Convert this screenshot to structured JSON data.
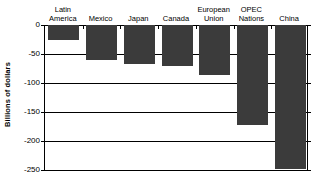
{
  "chart_data": {
    "type": "bar",
    "title": "",
    "xlabel": "",
    "ylabel": "Billions of dollars",
    "categories": [
      "Latin\nAmerica",
      "Mexico",
      "Japan",
      "Canada",
      "European\nUnion",
      "OPEC\nNations",
      "China"
    ],
    "values": [
      -25,
      -60,
      -67,
      -70,
      -86,
      -172,
      -248
    ],
    "ylim": [
      -250,
      0
    ],
    "yticks": [
      0,
      -50,
      -100,
      -150,
      -200,
      -250
    ],
    "ytick_labels": [
      "0",
      "-50",
      "-100",
      "-150",
      "-200",
      "-250"
    ],
    "grid": true,
    "legend": "none",
    "bar_color": "#3b3b3b",
    "axis_color": "#000000",
    "background": "#ffffff"
  }
}
